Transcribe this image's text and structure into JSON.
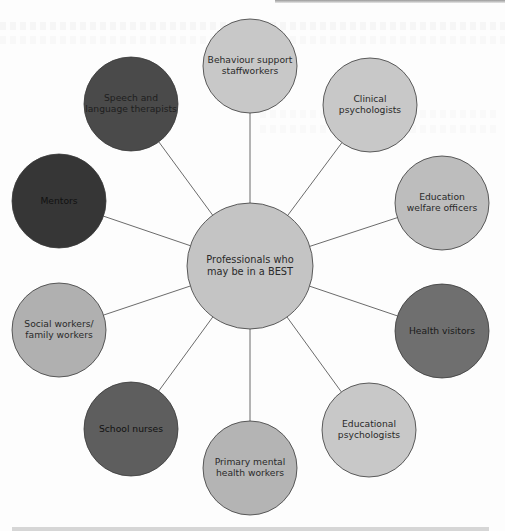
{
  "diagram": {
    "type": "hub-and-spoke",
    "center": {
      "label_lines": [
        "Professionals who",
        "may be in a BEST"
      ],
      "fill": "#c4c4c4",
      "text_color": "#2a2a2a"
    },
    "edge_color": "#5a5a5a",
    "stroke_color": "#3a3a3a",
    "nodes": [
      {
        "id": "behaviour-support",
        "label_lines": [
          "Behaviour support",
          "staffworkers"
        ],
        "fill": "#c8c8c8",
        "text_color": "#2a2a2a"
      },
      {
        "id": "clinical-psychologists",
        "label_lines": [
          "Clinical",
          "psychologists"
        ],
        "fill": "#c8c8c8",
        "text_color": "#2a2a2a"
      },
      {
        "id": "education-welfare-officers",
        "label_lines": [
          "Education",
          "welfare officers"
        ],
        "fill": "#bdbdbd",
        "text_color": "#2a2a2a"
      },
      {
        "id": "health-visitors",
        "label_lines": [
          "Health visitors"
        ],
        "fill": "#6f6f6f",
        "text_color": "#1a1a1a"
      },
      {
        "id": "educational-psychologists",
        "label_lines": [
          "Educational",
          "psychologists"
        ],
        "fill": "#c8c8c8",
        "text_color": "#2a2a2a"
      },
      {
        "id": "primary-mental-health-workers",
        "label_lines": [
          "Primary mental",
          "health workers"
        ],
        "fill": "#b4b4b4",
        "text_color": "#2a2a2a"
      },
      {
        "id": "school-nurses",
        "label_lines": [
          "School nurses"
        ],
        "fill": "#5e5e5e",
        "text_color": "#111111"
      },
      {
        "id": "social-family-workers",
        "label_lines": [
          "Social workers/",
          "family workers"
        ],
        "fill": "#b0b0b0",
        "text_color": "#2a2a2a"
      },
      {
        "id": "mentors",
        "label_lines": [
          "Mentors"
        ],
        "fill": "#363636",
        "text_color": "#111111"
      },
      {
        "id": "speech-language-therapists",
        "label_lines": [
          "Speech and",
          "language therapists"
        ],
        "fill": "#4a4a4a",
        "text_color": "#1e1e1e"
      }
    ]
  }
}
